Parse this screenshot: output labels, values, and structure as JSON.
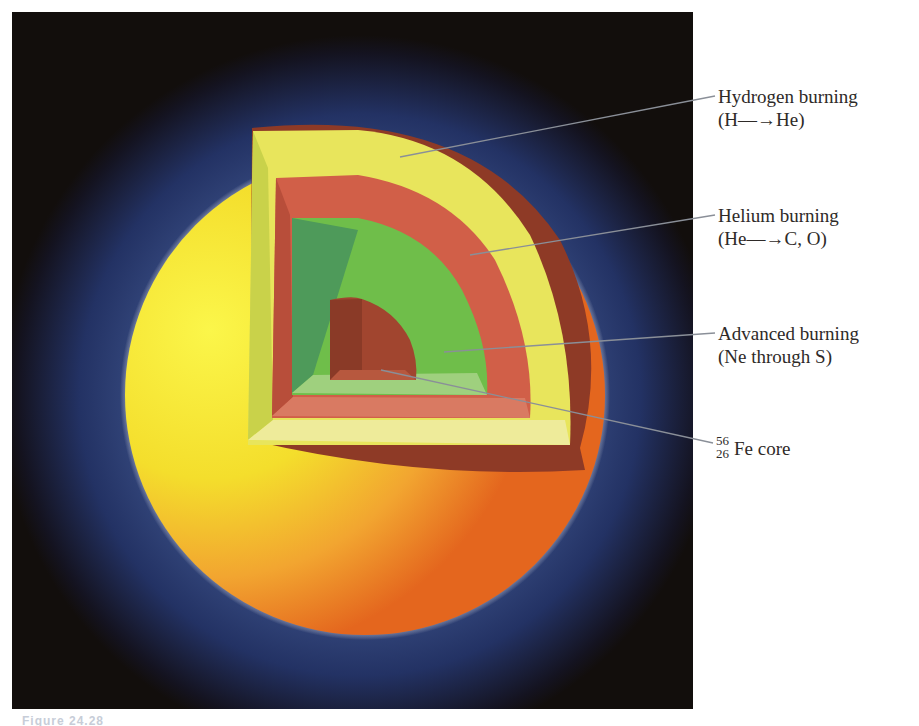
{
  "figure": {
    "caption": "Figure 24.28",
    "colors": {
      "background": "#120e0c",
      "halo_blue": "#2a3a6a",
      "photosphere_yellow": "#f4ee3a",
      "photosphere_orange": "#e8761f",
      "hydrogen_shell": "#e9e860",
      "helium_shell": "#d0604a",
      "advanced_shell": "#6fbf4c",
      "iron_core": "#9a3f2c",
      "leader_line": "#8a8f98",
      "label_text": "#2e2a28"
    },
    "labels": [
      {
        "name": "Hydrogen burning",
        "reaction": "(H—→He)"
      },
      {
        "name": "Helium burning",
        "reaction": "(He—→C, O)"
      },
      {
        "name": "Advanced burning",
        "reaction": "(Ne through S)"
      },
      {
        "name": "Fe core",
        "isotope_mass": "56",
        "isotope_z": "26"
      }
    ]
  }
}
